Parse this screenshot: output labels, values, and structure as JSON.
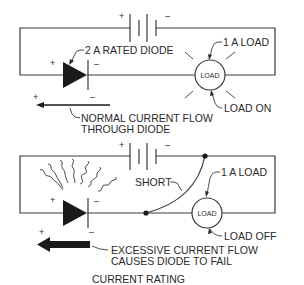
{
  "title": "CURRENT RATING",
  "colors": {
    "ink": "#2a2a2a",
    "background": "#ffffff"
  },
  "top_circuit": {
    "battery_plus": "+",
    "battery_minus": "–",
    "diode_label": "2 A RATED DIODE",
    "diode_plus": "+",
    "diode_minus": "–",
    "load_text": "LOAD",
    "load_rating_label": "1 A LOAD",
    "load_state_label": "LOAD ON",
    "arrow_plus": "+",
    "arrow_minus": "–",
    "flow_label_line1": "NORMAL CURRENT FLOW",
    "flow_label_line2": "THROUGH DIODE"
  },
  "bottom_circuit": {
    "battery_plus": "+",
    "battery_minus": "–",
    "short_label": "SHORT",
    "diode_plus": "+",
    "diode_minus": "–",
    "load_text": "LOAD",
    "load_rating_label": "1 A LOAD",
    "load_state_label": "LOAD OFF",
    "arrow_plus": "+",
    "arrow_minus": "–",
    "flow_label_line1": "EXCESSIVE CURRENT FLOW",
    "flow_label_line2": "CAUSES DIODE TO FAIL"
  }
}
